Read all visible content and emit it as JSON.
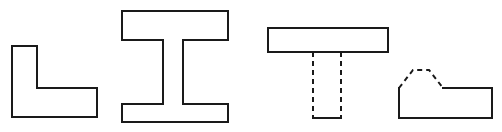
{
  "figure": {
    "canvas": {
      "width": 502,
      "height": 132,
      "background": "#ffffff"
    },
    "style": {
      "stroke_color": "#1a1a1a",
      "stroke_width": 2,
      "dash_pattern": "5 4",
      "fill": "none"
    },
    "shapes": [
      {
        "id": "l-shape",
        "name": "L-shaped angle section",
        "solid_path": "M 12 46 L 12 117 L 97 117 L 97 88 L 37 88 L 37 46 Z",
        "hidden_path": "M 37 46 L 37 88",
        "hidden_edge_orientation": "vertical",
        "bounds": {
          "x": 12,
          "y": 46,
          "width": 85,
          "height": 71
        }
      },
      {
        "id": "i-beam",
        "name": "I-beam / H section",
        "solid_path": "M 122 11 L 228 11 L 228 40 L 183 40 L 183 104 L 228 104 L 228 122 L 122 122 L 122 104 L 163 104 L 163 40 L 122 40 Z",
        "hidden_path": "M 122 40 L 163 40 M 183 40 L 228 40 M 122 104 L 163 104 M 183 104 L 228 104",
        "hidden_edge_orientation": "horizontal",
        "bounds": {
          "x": 122,
          "y": 11,
          "width": 106,
          "height": 111
        }
      },
      {
        "id": "t-shape",
        "name": "T-shaped tee section",
        "solid_path": "M 268 28 L 388 28 L 388 52 L 268 52 Z M 313 118 L 341 118",
        "hidden_path": "M 313 52 L 313 118 M 341 52 L 341 118",
        "hidden_edge_orientation": "vertical",
        "bounds": {
          "x": 268,
          "y": 28,
          "width": 120,
          "height": 90
        }
      },
      {
        "id": "bump-block",
        "name": "Block with trapezoidal boss",
        "solid_path": "M 399 88 L 399 118 L 492 118 L 492 88 L 443 88",
        "hidden_path": "M 399 88 L 413 70 L 429 70 L 443 88",
        "hidden_edge_orientation": "angled",
        "bounds": {
          "x": 399,
          "y": 70,
          "width": 93,
          "height": 48
        }
      }
    ]
  }
}
